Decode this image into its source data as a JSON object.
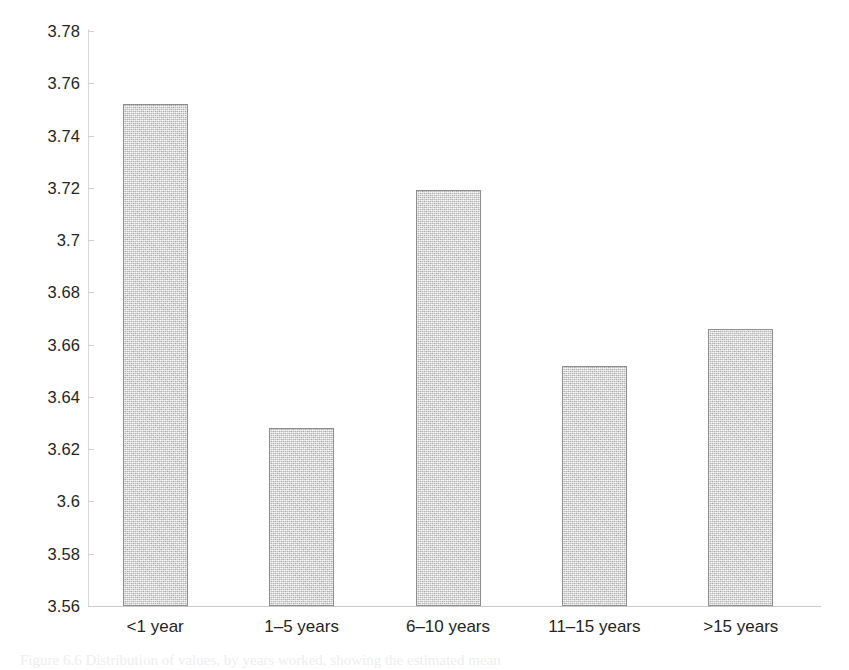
{
  "chart_data": {
    "type": "bar",
    "title": "",
    "subtitle": "",
    "xlabel": "",
    "ylabel": "",
    "categories": [
      "<1 year",
      "1–5 years",
      "6–10 years",
      "11–15 years",
      ">15 years"
    ],
    "values": [
      3.752,
      3.628,
      3.719,
      3.652,
      3.666
    ],
    "series": [
      {
        "name": "mean score",
        "values": [
          3.752,
          3.628,
          3.719,
          3.652,
          3.666
        ]
      }
    ],
    "ylim": [
      3.56,
      3.78
    ],
    "ytick_labels": [
      "3.78",
      "3.76",
      "3.74",
      "3.72",
      "3.7",
      "3.68",
      "3.66",
      "3.64",
      "3.62",
      "3.6",
      "3.58",
      "3.56"
    ],
    "ytick_values": [
      3.78,
      3.76,
      3.74,
      3.72,
      3.7,
      3.68,
      3.66,
      3.64,
      3.62,
      3.6,
      3.58,
      3.56
    ],
    "grid": false,
    "legend": null,
    "legend_position": "none",
    "bar_fill_color": "#c6c6c6",
    "bar_border_color": "#8d8d8d",
    "axis_color": "#cfcfcf",
    "text_color": "#242424"
  },
  "caption": {
    "text": "Figure 6.6 Distribution of values, by years worked, showing the estimated mean"
  }
}
